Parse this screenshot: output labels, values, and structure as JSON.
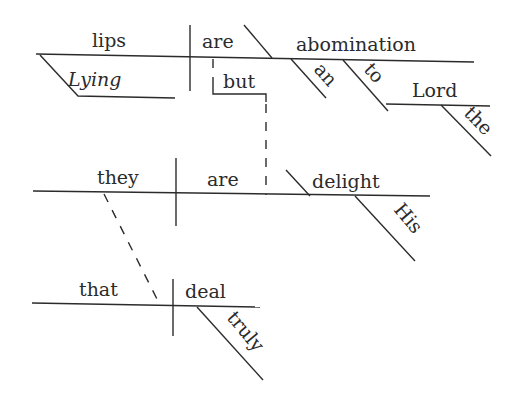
{
  "diagram": {
    "type": "sentence-diagram (Reed-Kellogg)",
    "sentence": "Lying lips are an abomination to the Lord, but they that deal truly are His delight.",
    "clause_1": {
      "subject": "lips",
      "subject_modifier": "Lying",
      "verb": "are",
      "predicate_nominative": "abomination",
      "article": "an",
      "preposition": "to",
      "prep_object": "Lord",
      "prep_object_article": "the"
    },
    "conjunction": "but",
    "clause_2": {
      "subject": "they",
      "verb": "are",
      "predicate_nominative": "delight",
      "possessive": "His"
    },
    "relative_clause": {
      "subject": "that",
      "verb": "deal",
      "adverb": "truly"
    }
  }
}
